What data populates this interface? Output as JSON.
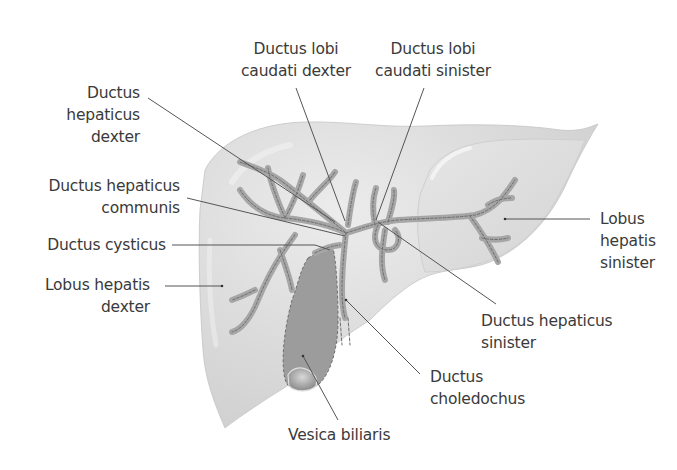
{
  "figure": {
    "colors": {
      "background": "#ffffff",
      "liver_fill": "#d9d9d9",
      "liver_highlight": "#ececec",
      "duct_fill": "#a6a6a6",
      "duct_dash": "#6e6e6e",
      "gallbladder_fill": "#9a9a9a",
      "leader_line": "#555555",
      "label_text": "#3a3a3a"
    }
  },
  "labels": {
    "ductus_lobi_caudati_dexter": {
      "line1": "Ductus lobi",
      "line2": "caudati dexter"
    },
    "ductus_lobi_caudati_sinister": {
      "line1": "Ductus lobi",
      "line2": "caudati sinister"
    },
    "ductus_hepaticus_dexter": {
      "line1": "Ductus",
      "line2": "hepaticus",
      "line3": "dexter"
    },
    "ductus_hepaticus_communis": {
      "line1": "Ductus hepaticus",
      "line2": "communis"
    },
    "ductus_cysticus": {
      "line1": "Ductus cysticus"
    },
    "lobus_hepatis_dexter": {
      "line1": "Lobus hepatis",
      "line2": "dexter"
    },
    "lobus_hepatis_sinister": {
      "line1": "Lobus",
      "line2": "hepatis",
      "line3": "sinister"
    },
    "ductus_hepaticus_sinister": {
      "line1": "Ductus hepaticus",
      "line2": "sinister"
    },
    "ductus_choledochus": {
      "line1": "Ductus",
      "line2": "choledochus"
    },
    "vesica_biliaris": {
      "line1": "Vesica biliaris"
    }
  }
}
